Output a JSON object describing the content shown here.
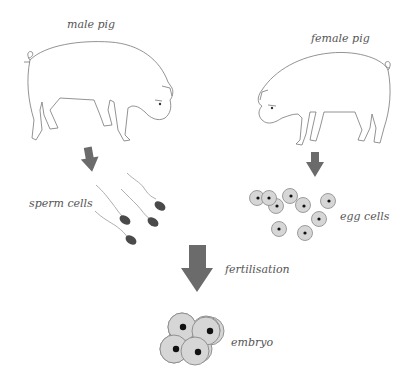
{
  "diagram": {
    "labels": {
      "male_pig": "male pig",
      "female_pig": "female pig",
      "sperm_cells": "sperm cells",
      "egg_cells": "egg cells",
      "fertilisation": "fertilisation",
      "embryo": "embryo"
    },
    "colors": {
      "arrow": "#6b6b6b",
      "cell_fill": "#d6d6d6",
      "cell_stroke": "#888888",
      "nucleus": "#111111",
      "sperm_head": "#4a4a4a",
      "outline": "#777777",
      "text": "#555555"
    },
    "nodes": [
      {
        "id": "male-pig",
        "label": "male pig"
      },
      {
        "id": "female-pig",
        "label": "female pig"
      },
      {
        "id": "sperm-cells",
        "label": "sperm cells",
        "count": 4
      },
      {
        "id": "egg-cells",
        "label": "egg cells",
        "count": 9
      },
      {
        "id": "embryo",
        "label": "embryo",
        "cell_count": 4
      }
    ],
    "edges": [
      {
        "from": "male-pig",
        "to": "sperm-cells"
      },
      {
        "from": "female-pig",
        "to": "egg-cells"
      },
      {
        "from": "sperm-cells+egg-cells",
        "to": "embryo",
        "label": "fertilisation"
      }
    ]
  }
}
